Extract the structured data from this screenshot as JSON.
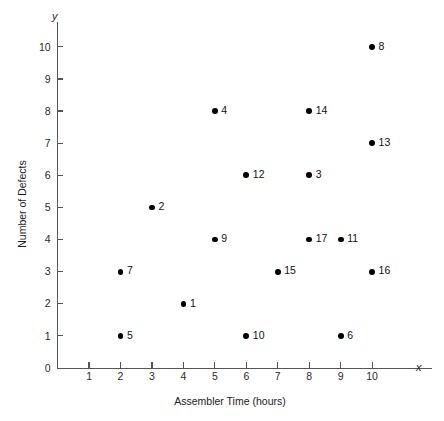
{
  "chart_data": {
    "type": "scatter",
    "title": "",
    "xlabel": "Assembler Time (hours)",
    "ylabel": "Number of Defects",
    "x_axis_symbol": "x",
    "y_axis_symbol": "y",
    "xlim": [
      0,
      10
    ],
    "ylim": [
      0,
      10
    ],
    "xticks": [
      0,
      1,
      2,
      3,
      4,
      5,
      6,
      7,
      8,
      9,
      10
    ],
    "yticks": [
      0,
      1,
      2,
      3,
      4,
      5,
      6,
      7,
      8,
      9,
      10
    ],
    "xtick_labels": [
      "0",
      "1",
      "2",
      "3",
      "4",
      "5",
      "6",
      "7",
      "8",
      "9",
      "10"
    ],
    "ytick_labels": [
      "0",
      "1",
      "2",
      "3",
      "4",
      "5",
      "6",
      "7",
      "8",
      "9",
      "10"
    ],
    "grid": false,
    "legend": false,
    "marker_color": "#000000",
    "axis_color": "#555555",
    "background_color": "#ffffff",
    "points": [
      {
        "label": "1",
        "x": 4,
        "y": 2
      },
      {
        "label": "2",
        "x": 3,
        "y": 5
      },
      {
        "label": "3",
        "x": 8,
        "y": 6
      },
      {
        "label": "4",
        "x": 5,
        "y": 8
      },
      {
        "label": "5",
        "x": 2,
        "y": 1
      },
      {
        "label": "6",
        "x": 9,
        "y": 1
      },
      {
        "label": "7",
        "x": 2,
        "y": 3
      },
      {
        "label": "8",
        "x": 10,
        "y": 10
      },
      {
        "label": "9",
        "x": 5,
        "y": 4
      },
      {
        "label": "10",
        "x": 6,
        "y": 1
      },
      {
        "label": "11",
        "x": 9,
        "y": 4
      },
      {
        "label": "12",
        "x": 6,
        "y": 6
      },
      {
        "label": "13",
        "x": 10,
        "y": 7
      },
      {
        "label": "14",
        "x": 8,
        "y": 8
      },
      {
        "label": "15",
        "x": 7,
        "y": 3
      },
      {
        "label": "16",
        "x": 10,
        "y": 3
      },
      {
        "label": "17",
        "x": 8,
        "y": 4
      }
    ]
  }
}
